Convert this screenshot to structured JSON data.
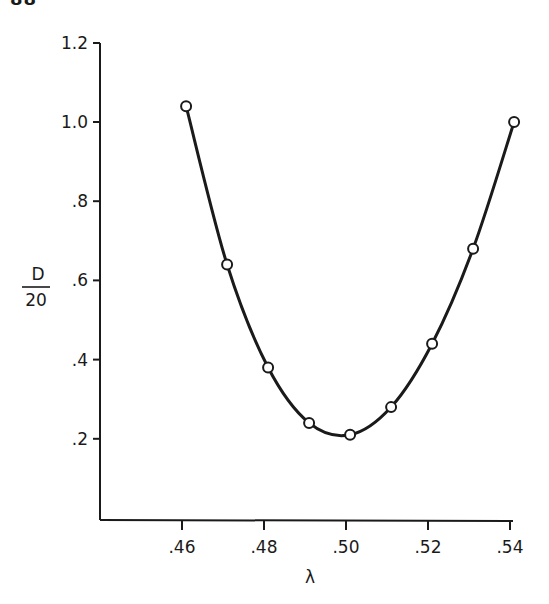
{
  "page": {
    "page_number_fragment": "88"
  },
  "chart_data": {
    "type": "line",
    "title": "",
    "xlabel": "λ",
    "ylabel_numerator": "D",
    "ylabel_denominator": "20",
    "ylabel": "D/20",
    "x_ticks": [
      0.46,
      0.48,
      0.5,
      0.52,
      0.54
    ],
    "x_tick_labels": [
      ".46",
      ".48",
      ".50",
      ".52",
      ".54"
    ],
    "y_ticks": [
      0.2,
      0.4,
      0.6,
      0.8,
      1.0,
      1.2
    ],
    "y_tick_labels": [
      ".2",
      ".4",
      ".6",
      ".8",
      "1.0",
      "1.2"
    ],
    "xlim": [
      0.44,
      0.54
    ],
    "ylim": [
      0.0,
      1.2
    ],
    "grid": false,
    "legend": null,
    "marker": "open-circle",
    "line_style": "smooth-solid",
    "series": [
      {
        "name": "D/20 vs λ",
        "x": [
          0.461,
          0.471,
          0.481,
          0.491,
          0.501,
          0.511,
          0.521,
          0.531,
          0.541
        ],
        "values": [
          1.04,
          0.64,
          0.38,
          0.24,
          0.21,
          0.28,
          0.44,
          0.68,
          1.0
        ]
      }
    ]
  },
  "colors": {
    "ink": "#1a1a1a",
    "background": "#ffffff",
    "marker_fill": "#ffffff"
  }
}
